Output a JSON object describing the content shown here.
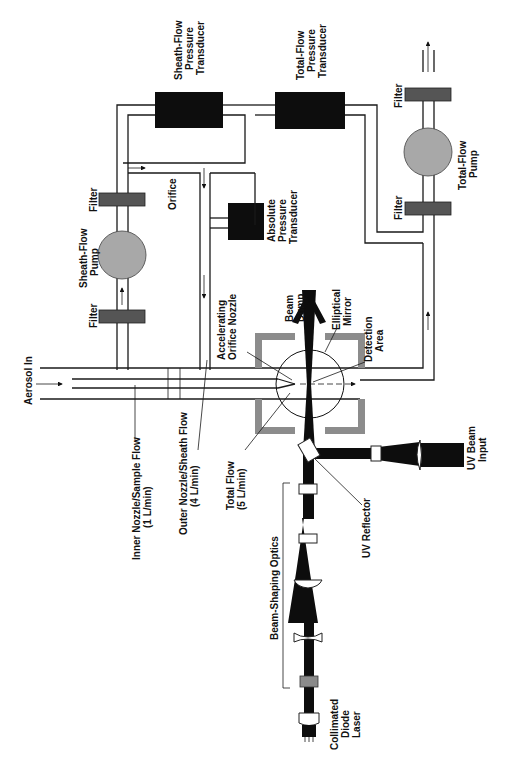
{
  "figure": {
    "orientation": "rotated-90-ccw"
  },
  "labels": {
    "sheath_flow_pressure_transducer": [
      "Sheath-Flow",
      "Pressure",
      "Transducer"
    ],
    "total_flow_pressure_transducer": [
      "Total-Flow",
      "Pressure",
      "Transducer"
    ],
    "absolute_pressure_transducer": [
      "Absolute",
      "Pressure",
      "Transducer"
    ],
    "sheath_flow_pump": [
      "Sheath-Flow",
      "Pump"
    ],
    "total_flow_pump": [
      "Total-Flow",
      "Pump"
    ],
    "filter_1": "Filter",
    "filter_2": "Filter",
    "filter_3": "Filter",
    "filter_4": "Filter",
    "orifice": "Orifice",
    "accelerating_orifice_nozzle": [
      "Accelerating",
      "Orifice Nozzle"
    ],
    "beam_dump": [
      "Beam",
      "Dump"
    ],
    "elliptical_mirror": [
      "Elliptical",
      "Mirror"
    ],
    "detection_area": [
      "Detection",
      "Area"
    ],
    "aerosol_in": "Aerosol In",
    "inner_nozzle": [
      "Inner Nozzle/Sample Flow",
      "(1 L/min)"
    ],
    "outer_nozzle": [
      "Outer Nozzle/Sheath Flow",
      "(4 L/min)"
    ],
    "total_flow": [
      "Total Flow",
      "(5 L/min)"
    ],
    "uv_reflector": "UV Reflector",
    "uv_beam_input": [
      "UV Beam",
      "Input"
    ],
    "beam_shaping_optics": "Beam-Shaping Optics",
    "collimated_diode_laser": [
      "Collimated",
      "Diode",
      "Laser"
    ]
  },
  "colors": {
    "transducer": "#0d0d0d",
    "pump": "#a8a8a8",
    "filter": "#555555",
    "chamber_wall": "#8c8c8c",
    "beam": "#0d0d0d"
  }
}
